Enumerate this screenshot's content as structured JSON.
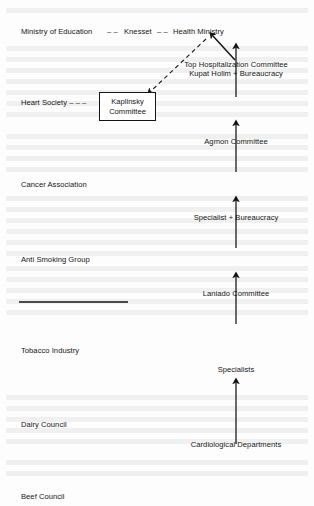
{
  "figure": {
    "background_color": "#fdfdfd",
    "ink_color": "#151515"
  },
  "top_row": {
    "separator": "– –",
    "nodes": [
      {
        "label": "Ministry of Education"
      },
      {
        "label": "Knesset"
      },
      {
        "label": "Health Ministry"
      }
    ]
  },
  "left_column": {
    "items": [
      {
        "label": "Heart Society",
        "trailing_dashes": "– – –"
      },
      {
        "label": "Cancer Association"
      },
      {
        "label": "Anti Smoking Group"
      },
      {
        "label": "Tobacco Industry"
      },
      {
        "label": "Dairy Council"
      },
      {
        "label": "Beef Council"
      }
    ],
    "divider": {
      "name": "horizontal-rule"
    }
  },
  "boxed_node": {
    "line1": "Kaplinsky",
    "line2": "Committee"
  },
  "right_column": {
    "nodes": [
      {
        "line1": "Top Hospitalization Committee",
        "line2": "Kupat Holim + Bureaucracy"
      },
      {
        "line1": "Agmon Committee"
      },
      {
        "line1": "Specialist + Bureaucracy"
      },
      {
        "line1": "Laniado Committee"
      },
      {
        "line1": "Specialists"
      },
      {
        "line1": "Cardiological Departments"
      }
    ]
  },
  "connectors": {
    "solid_arrows": [
      {
        "from": "Agmon Committee",
        "to": "Top Hospitalization Committee"
      },
      {
        "from": "Specialist + Bureaucracy",
        "to": "Agmon Committee"
      },
      {
        "from": "Laniado Committee",
        "to": "Specialist + Bureaucracy"
      },
      {
        "from": "Specialists",
        "to": "Laniado Committee"
      },
      {
        "from": "Cardiological Departments",
        "to": "Specialists"
      },
      {
        "from": "Top Hospitalization Committee",
        "to": "Health Ministry"
      }
    ],
    "dashed_arrows": [
      {
        "from": "Health Ministry",
        "to": "Kaplinsky Committee"
      },
      {
        "from": "Heart Society",
        "to": "Kaplinsky Committee"
      }
    ]
  }
}
